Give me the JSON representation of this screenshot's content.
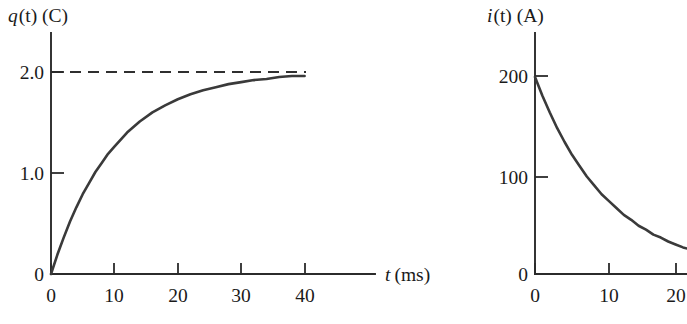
{
  "figure": {
    "name": "rc-circuit-charge-and-current-vs-time",
    "background_color": "#ffffff",
    "ink_color": "#2b2b2b",
    "curve_color": "#3a3a3a"
  },
  "panels": [
    {
      "id": "charge-plot",
      "axis_title_italic": "q",
      "axis_title_rest": "(t) (C)",
      "axis_title_full": "q(t) (C)",
      "x_axis_label_italic": "t",
      "x_axis_label_rest": "(ms)",
      "x_axis_label_full": "t (ms)",
      "y_ticks": [
        "2.0",
        "1.0",
        "0"
      ],
      "x_ticks": [
        "0",
        "10",
        "20",
        "30",
        "40"
      ],
      "asymptote_label": "2.0"
    },
    {
      "id": "current-plot",
      "axis_title_italic": "i",
      "axis_title_rest": "(t) (A)",
      "axis_title_full": "i(t) (A)",
      "x_axis_label_italic": "",
      "x_axis_label_rest": "",
      "x_axis_label_full": "",
      "y_ticks": [
        "200",
        "100",
        "0"
      ],
      "x_ticks": [
        "0",
        "10",
        "20"
      ],
      "asymptote_label": ""
    }
  ],
  "chart_data": [
    {
      "type": "line",
      "id": "charge-plot",
      "title": "q(t) (C)",
      "xlabel": "t (ms)",
      "ylabel": "q(t) (C)",
      "xlim": [
        0,
        44
      ],
      "ylim": [
        0,
        2.3
      ],
      "xticks": [
        0,
        10,
        20,
        30,
        40
      ],
      "xticklabels": [
        "0",
        "10",
        "20",
        "30",
        "40"
      ],
      "yticks": [
        0,
        1.0,
        2.0
      ],
      "yticklabels": [
        "0",
        "1.0",
        "2.0"
      ],
      "grid": false,
      "legend": null,
      "annotations": [
        {
          "kind": "horizontal-dashed-asymptote",
          "y": 2.0,
          "label": "2.0",
          "x_from": 0,
          "x_to": 40
        }
      ],
      "series": [
        {
          "name": "q(t) = 2.0(1 - e^(-t/10))",
          "style": "solid",
          "x": [
            0,
            1,
            2,
            3,
            4,
            5,
            6,
            7,
            8,
            9,
            10,
            12,
            14,
            16,
            18,
            20,
            22,
            24,
            26,
            28,
            30,
            32,
            34,
            36,
            38,
            40
          ],
          "y": [
            0.0,
            0.19,
            0.36,
            0.52,
            0.66,
            0.79,
            0.9,
            1.01,
            1.1,
            1.19,
            1.26,
            1.4,
            1.51,
            1.6,
            1.67,
            1.73,
            1.78,
            1.82,
            1.85,
            1.88,
            1.9,
            1.92,
            1.93,
            1.95,
            1.96,
            1.96
          ]
        }
      ]
    },
    {
      "type": "line",
      "id": "current-plot",
      "title": "i(t) (A)",
      "xlabel": "",
      "ylabel": "i(t) (A)",
      "xlim": [
        0,
        22
      ],
      "ylim": [
        0,
        230
      ],
      "xticks": [
        0,
        10,
        20
      ],
      "xticklabels": [
        "0",
        "10",
        "20"
      ],
      "yticks": [
        0,
        100,
        200
      ],
      "yticklabels": [
        "0",
        "100",
        "200"
      ],
      "grid": false,
      "legend": null,
      "annotations": [],
      "series": [
        {
          "name": "i(t) = 200 e^(-t/10)",
          "style": "solid",
          "x": [
            0,
            1,
            2,
            3,
            4,
            5,
            6,
            7,
            8,
            9,
            10,
            11,
            12,
            13,
            14,
            15,
            16,
            17,
            18,
            19,
            20,
            21
          ],
          "y": [
            200,
            181,
            164,
            148,
            134,
            121,
            110,
            99,
            90,
            81,
            74,
            67,
            60,
            55,
            49,
            45,
            40,
            37,
            33,
            30,
            27,
            25
          ]
        }
      ]
    }
  ]
}
